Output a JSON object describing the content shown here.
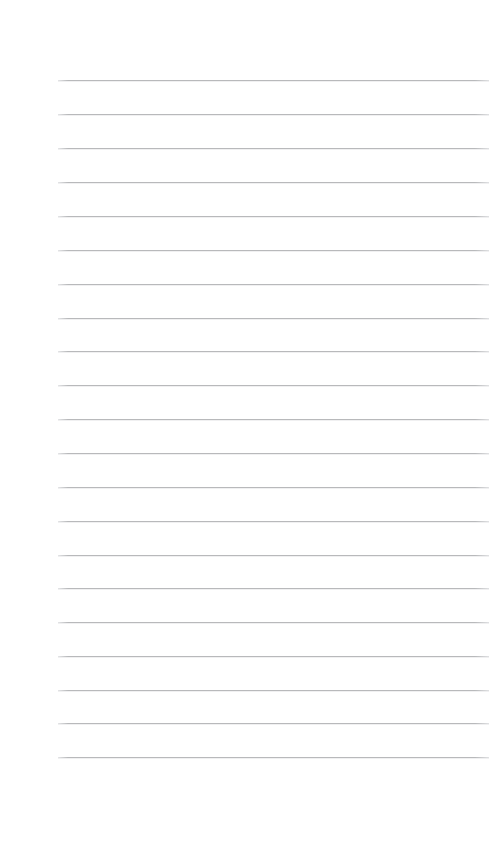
{
  "page": {
    "kind": "blank-ruled-paper",
    "width": 504,
    "height": 841,
    "background_color": "#ffffff",
    "written_text": ""
  },
  "ruling": {
    "line_color": "#b8b9bb",
    "line_thickness": 1,
    "line_count": 21,
    "first_line_y": 80,
    "line_spacing": 33.85,
    "left_margin_x": 58,
    "right_margin_x": 489,
    "line_length": 431,
    "top_blank_space": 80,
    "bottom_blank_space": 84,
    "has_vertical_margin_rule": false,
    "lines": [
      {
        "index": 1,
        "y": 80,
        "x1": 58,
        "x2": 489,
        "content": ""
      },
      {
        "index": 2,
        "y": 114,
        "x1": 58,
        "x2": 489,
        "content": ""
      },
      {
        "index": 3,
        "y": 148,
        "x1": 58,
        "x2": 489,
        "content": ""
      },
      {
        "index": 4,
        "y": 182,
        "x1": 58,
        "x2": 489,
        "content": ""
      },
      {
        "index": 5,
        "y": 216,
        "x1": 58,
        "x2": 489,
        "content": ""
      },
      {
        "index": 6,
        "y": 250,
        "x1": 58,
        "x2": 489,
        "content": ""
      },
      {
        "index": 7,
        "y": 284,
        "x1": 58,
        "x2": 489,
        "content": ""
      },
      {
        "index": 8,
        "y": 318,
        "x1": 58,
        "x2": 489,
        "content": ""
      },
      {
        "index": 9,
        "y": 351,
        "x1": 58,
        "x2": 489,
        "content": ""
      },
      {
        "index": 10,
        "y": 385,
        "x1": 58,
        "x2": 489,
        "content": ""
      },
      {
        "index": 11,
        "y": 419,
        "x1": 58,
        "x2": 489,
        "content": ""
      },
      {
        "index": 12,
        "y": 453,
        "x1": 58,
        "x2": 489,
        "content": ""
      },
      {
        "index": 13,
        "y": 487,
        "x1": 58,
        "x2": 489,
        "content": ""
      },
      {
        "index": 14,
        "y": 521,
        "x1": 58,
        "x2": 489,
        "content": ""
      },
      {
        "index": 15,
        "y": 555,
        "x1": 58,
        "x2": 489,
        "content": ""
      },
      {
        "index": 16,
        "y": 588,
        "x1": 58,
        "x2": 489,
        "content": ""
      },
      {
        "index": 17,
        "y": 622,
        "x1": 58,
        "x2": 489,
        "content": ""
      },
      {
        "index": 18,
        "y": 656,
        "x1": 58,
        "x2": 489,
        "content": ""
      },
      {
        "index": 19,
        "y": 690,
        "x1": 58,
        "x2": 489,
        "content": ""
      },
      {
        "index": 20,
        "y": 723,
        "x1": 58,
        "x2": 489,
        "content": ""
      },
      {
        "index": 21,
        "y": 757,
        "x1": 58,
        "x2": 489,
        "content": ""
      }
    ]
  }
}
